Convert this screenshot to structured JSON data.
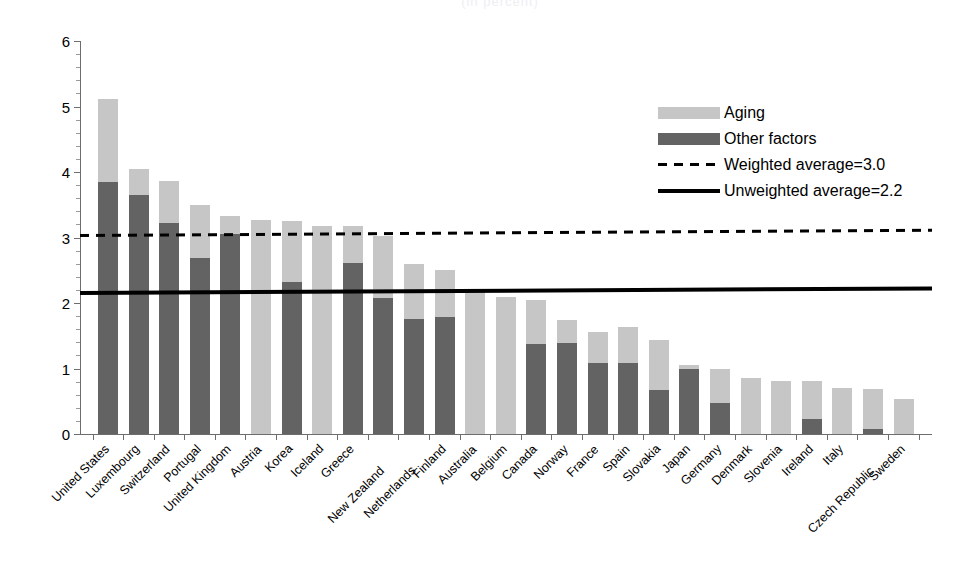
{
  "chart_data": {
    "type": "bar",
    "subtype": "stacked-bar-with-reference-lines",
    "title": "",
    "cropped_title_remnant": "(in percent)",
    "xlabel": "",
    "ylabel": "",
    "ylim": [
      0,
      6
    ],
    "yticks": [
      0,
      1,
      2,
      3,
      4,
      5,
      6
    ],
    "ytick_labels": [
      "0",
      "1",
      "2",
      "3",
      "4",
      "5",
      "6"
    ],
    "grid": false,
    "legend_position": "upper-right",
    "categories": [
      "United States",
      "Luxembourg",
      "Switzerland",
      "Portugal",
      "United Kingdom",
      "Austria",
      "Korea",
      "Iceland",
      "Greece",
      "New Zealand",
      "Netherlands",
      "Finland",
      "Australia",
      "Belgium",
      "Canada",
      "Norway",
      "France",
      "Spain",
      "Slovakia",
      "Japan",
      "Germany",
      "Denmark",
      "Slovenia",
      "Ireland",
      "Italy",
      "Czech Republic",
      "Sweden"
    ],
    "series": [
      {
        "name": "Other factors",
        "color": "#636363",
        "values": [
          3.84,
          3.65,
          3.22,
          2.68,
          3.05,
          0.0,
          2.32,
          0.0,
          2.61,
          2.07,
          1.76,
          1.79,
          0.0,
          0.0,
          1.37,
          1.39,
          1.09,
          1.08,
          0.67,
          1.0,
          0.47,
          0.0,
          0.0,
          0.23,
          0.0,
          0.08,
          0.0
        ]
      },
      {
        "name": "Aging",
        "color": "#c6c6c6",
        "values": [
          1.28,
          0.4,
          0.64,
          0.82,
          0.28,
          3.26,
          0.93,
          3.18,
          0.57,
          0.96,
          0.84,
          0.72,
          2.17,
          2.09,
          0.67,
          0.35,
          0.47,
          0.55,
          0.76,
          0.05,
          0.52,
          0.85,
          0.81,
          0.58,
          0.7,
          0.6,
          0.53
        ]
      }
    ],
    "totals": [
      5.12,
      4.05,
      3.86,
      3.5,
      3.33,
      3.26,
      3.25,
      3.18,
      3.18,
      3.03,
      2.6,
      2.51,
      2.17,
      2.09,
      2.04,
      1.74,
      1.56,
      1.63,
      1.23,
      1.05,
      0.99,
      0.85,
      0.81,
      0.81,
      0.7,
      0.68,
      0.53
    ],
    "reference_lines": [
      {
        "name": "Weighted average",
        "value": 3.0,
        "label": "Weighted average=3.0",
        "style": "dashed",
        "color": "#000000",
        "start_value": 3.05,
        "end_value": 3.13
      },
      {
        "name": "Unweighted average",
        "value": 2.2,
        "label": "Unweighted average=2.2",
        "style": "solid",
        "color": "#000000",
        "start_value": 2.18,
        "end_value": 2.25
      }
    ]
  },
  "legend": {
    "items": [
      {
        "label": "Aging",
        "type": "swatch-light"
      },
      {
        "label": "Other factors",
        "type": "swatch-dark"
      },
      {
        "label": "Weighted average=3.0",
        "type": "dashed-line"
      },
      {
        "label": "Unweighted average=2.2",
        "type": "solid-line"
      }
    ]
  }
}
